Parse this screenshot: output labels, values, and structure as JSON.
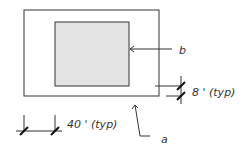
{
  "diagram": {
    "type": "plan-section-sketch",
    "colors": {
      "line": "#333333",
      "inner_fill": "#e4e4e4",
      "background": "#ffffff"
    },
    "labels": {
      "inner_callout": "b",
      "outer_callout": "a",
      "border_dimension": "8 ' (typ)",
      "spacing_dimension": "40 ' (typ)"
    }
  }
}
